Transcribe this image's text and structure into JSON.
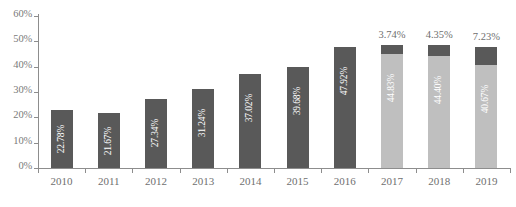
{
  "chart_data": {
    "type": "bar",
    "title": "",
    "subtitle": "",
    "xlabel": "",
    "ylabel": "",
    "grid": false,
    "legend": "none",
    "stacked": true,
    "categories": [
      "2010",
      "2011",
      "2012",
      "2013",
      "2014",
      "2015",
      "2016",
      "2017",
      "2018",
      "2019"
    ],
    "ylim": [
      0,
      60
    ],
    "ytick_values": [
      0,
      10,
      20,
      30,
      40,
      50,
      60
    ],
    "ytick_labels": [
      "0%",
      "10%",
      "20%",
      "30%",
      "40%",
      "50%",
      "60%"
    ],
    "series": [
      {
        "name": "lower-segment",
        "color": "#595959",
        "values": [
          22.78,
          21.67,
          27.34,
          31.24,
          37.02,
          39.68,
          47.92,
          44.83,
          44.4,
          40.67
        ],
        "labels": [
          "22.78%",
          "21.67%",
          "27.34%",
          "31.24%",
          "37.02%",
          "39.68%",
          "47.92%",
          "44.83%",
          "44.40%",
          "40.67%"
        ],
        "label_position": "inside-rotated",
        "label_color": "#ffffff"
      },
      {
        "name": "upper-segment",
        "color": "#595959",
        "values": [
          0,
          0,
          0,
          0,
          0,
          0,
          0,
          3.74,
          4.35,
          7.23
        ],
        "labels": [
          "",
          "",
          "",
          "",
          "",
          "",
          "",
          "3.74%",
          "4.35%",
          "7.23%"
        ],
        "label_position": "above-bar",
        "label_color": "#6f6f6f"
      }
    ],
    "bars": [
      {
        "category": "2010",
        "lower_value": 22.78,
        "lower_label": "22.78%",
        "lower_color": "#595959",
        "upper_value": 0,
        "upper_label": "",
        "upper_color": "#595959",
        "stacked": false
      },
      {
        "category": "2011",
        "lower_value": 21.67,
        "lower_label": "21.67%",
        "lower_color": "#595959",
        "upper_value": 0,
        "upper_label": "",
        "upper_color": "#595959",
        "stacked": false
      },
      {
        "category": "2012",
        "lower_value": 27.34,
        "lower_label": "27.34%",
        "lower_color": "#595959",
        "upper_value": 0,
        "upper_label": "",
        "upper_color": "#595959",
        "stacked": false
      },
      {
        "category": "2013",
        "lower_value": 31.24,
        "lower_label": "31.24%",
        "lower_color": "#595959",
        "upper_value": 0,
        "upper_label": "",
        "upper_color": "#595959",
        "stacked": false
      },
      {
        "category": "2014",
        "lower_value": 37.02,
        "lower_label": "37.02%",
        "lower_color": "#595959",
        "upper_value": 0,
        "upper_label": "",
        "upper_color": "#595959",
        "stacked": false
      },
      {
        "category": "2015",
        "lower_value": 39.68,
        "lower_label": "39.68%",
        "lower_color": "#595959",
        "upper_value": 0,
        "upper_label": "",
        "upper_color": "#595959",
        "stacked": false
      },
      {
        "category": "2016",
        "lower_value": 47.92,
        "lower_label": "47.92%",
        "lower_color": "#595959",
        "upper_value": 0,
        "upper_label": "",
        "upper_color": "#595959",
        "stacked": false
      },
      {
        "category": "2017",
        "lower_value": 44.83,
        "lower_label": "44.83%",
        "lower_color": "#bfbfbf",
        "upper_value": 3.74,
        "upper_label": "3.74%",
        "upper_color": "#595959",
        "stacked": true
      },
      {
        "category": "2018",
        "lower_value": 44.4,
        "lower_label": "44.40%",
        "lower_color": "#bfbfbf",
        "upper_value": 4.35,
        "upper_label": "4.35%",
        "upper_color": "#595959",
        "stacked": true
      },
      {
        "category": "2019",
        "lower_value": 40.67,
        "lower_label": "40.67%",
        "lower_color": "#bfbfbf",
        "upper_value": 7.23,
        "upper_label": "7.23%",
        "upper_color": "#595959",
        "stacked": true
      }
    ],
    "colors": {
      "dark_bar": "#595959",
      "light_bar": "#bfbfbf",
      "axis": "#8d8d8d",
      "axis_text": "#6f6f6f",
      "inner_label_text": "#ffffff",
      "background": "#ffffff"
    }
  }
}
